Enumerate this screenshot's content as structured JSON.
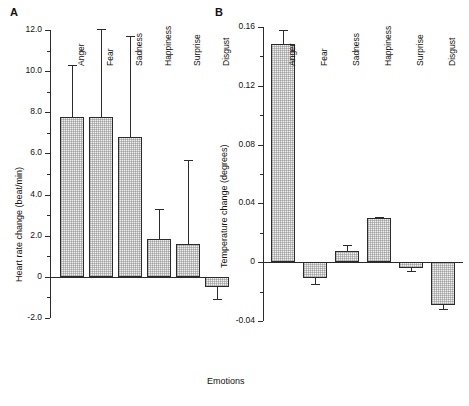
{
  "figure": {
    "xlabel": "Emotions",
    "background": "#ffffff",
    "ink_color": "#2b2b2b"
  },
  "panels": [
    {
      "letter": "A",
      "ylabel": "Heart rate change  (beat/min)",
      "yticks": [
        "12.0",
        "10.0",
        "8.0",
        "6.0",
        "4.0",
        "2.0",
        "0",
        "-2.0"
      ],
      "categories": [
        "Anger",
        "Fear",
        "Sadness",
        "Happiness",
        "Surprise",
        "Disgust"
      ]
    },
    {
      "letter": "B",
      "ylabel": "Temperature change (degrees)",
      "yticks": [
        "0.16",
        "0.12",
        "0.08",
        "0.04",
        "0",
        "-0.04"
      ],
      "categories": [
        "Anger",
        "Fear",
        "Sadness",
        "Happiness",
        "Surprise",
        "Disgust"
      ]
    }
  ],
  "chart_data": [
    {
      "type": "bar",
      "panel": "A",
      "title": "",
      "xlabel": "Emotions",
      "ylabel": "Heart rate change  (beat/min)",
      "categories": [
        "Anger",
        "Fear",
        "Sadness",
        "Happiness",
        "Surprise",
        "Disgust"
      ],
      "values": [
        7.8,
        7.8,
        6.8,
        1.85,
        1.6,
        -0.5
      ],
      "error_upper": [
        10.3,
        12.05,
        11.7,
        3.3,
        5.7,
        -1.1
      ],
      "error_direction": [
        "up",
        "up",
        "up",
        "up",
        "up",
        "down"
      ],
      "ytick_values": [
        12.0,
        10.0,
        8.0,
        6.0,
        4.0,
        2.0,
        0,
        -2.0
      ],
      "ytick_labels": [
        "12.0",
        "10.0",
        "8.0",
        "6.0",
        "4.0",
        "2.0",
        "0",
        "-2.0"
      ],
      "minor_ticks_per_interval": 1,
      "ylim": [
        -2.6,
        12.6
      ],
      "grid": false,
      "legend": false
    },
    {
      "type": "bar",
      "panel": "B",
      "title": "",
      "xlabel": "Emotions",
      "ylabel": "Temperature change (degrees)",
      "categories": [
        "Anger",
        "Fear",
        "Sadness",
        "Happiness",
        "Surprise",
        "Disgust"
      ],
      "values": [
        0.148,
        -0.011,
        0.008,
        0.03,
        -0.004,
        -0.029
      ],
      "error_upper": [
        0.158,
        -0.0145,
        0.0115,
        0.0305,
        -0.0058,
        -0.0315
      ],
      "error_direction": [
        "up",
        "down",
        "up",
        "up",
        "down",
        "down"
      ],
      "ytick_values": [
        0.16,
        0.12,
        0.08,
        0.04,
        0,
        -0.04
      ],
      "ytick_labels": [
        "0.16",
        "0.12",
        "0.08",
        "0.04",
        "0",
        "-0.04"
      ],
      "minor_ticks_per_interval": 1,
      "ylim": [
        -0.046,
        0.166
      ],
      "grid": false,
      "legend": false
    }
  ]
}
